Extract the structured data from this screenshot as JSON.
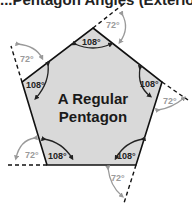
{
  "title_partial": "...Pentagon Angles (Exterior)",
  "shape": {
    "name_line1": "A Regular",
    "name_line2": "Pentagon",
    "fill": "#d9d9d9",
    "stroke": "#111111"
  },
  "angles": {
    "interior": [
      "108°",
      "108°",
      "108°",
      "108°",
      "108°"
    ],
    "exterior": [
      "72°",
      "72°",
      "72°",
      "72°",
      "72°"
    ],
    "interior_color": "#222222",
    "exterior_color": "#9a9a9a"
  }
}
